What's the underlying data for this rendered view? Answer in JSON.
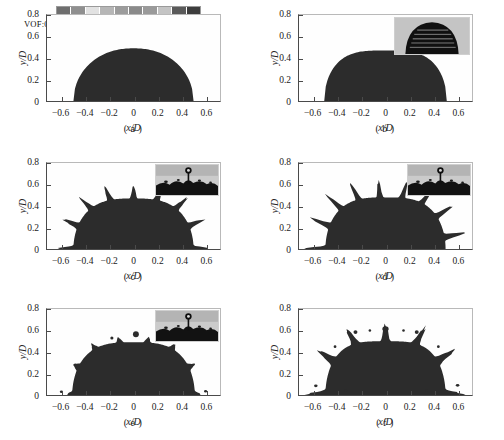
{
  "figure": {
    "type": "multi-panel-contour",
    "panel_count": 6,
    "colors": {
      "liquid": "#2c2c2c",
      "liquid_edge": "#3a3a3a",
      "background": "#fefefe",
      "axis": "#4a4a4a",
      "inset_bg": "#c9c9c9",
      "inset_dark": "#141414"
    }
  },
  "axes": {
    "xlabel": "x/D",
    "ylabel": "y/D",
    "xticks": [
      "-0.6",
      "-0.4",
      "-0.2",
      "0",
      "0.2",
      "0.4",
      "0.6"
    ],
    "xtick_values": [
      -0.6,
      -0.4,
      -0.2,
      0,
      0.2,
      0.4,
      0.6
    ],
    "yticks": [
      "0",
      "0.2",
      "0.4",
      "0.6",
      "0.8"
    ],
    "ytick_values": [
      0,
      0.2,
      0.4,
      0.6,
      0.8
    ],
    "xlim": [
      -0.72,
      0.72
    ],
    "ylim": [
      0,
      0.8
    ]
  },
  "colorbar": {
    "title": "VOF:",
    "labels": [
      "0.1",
      "0.2",
      "0.3",
      "0.4",
      "0.5",
      "0.6",
      "0.7",
      "0.8",
      "0.9"
    ],
    "values": [
      0.1,
      0.2,
      0.3,
      0.4,
      0.5,
      0.6,
      0.7,
      0.8,
      0.9
    ],
    "swatches": [
      "#6e6e6e",
      "#8f8f8f",
      "#e2e2e2",
      "#b6b6b6",
      "#9c9c9c",
      "#8a8a8a",
      "#9a9a9a",
      "#c4c4c4",
      "#5a5a5a",
      "#3d3d3d"
    ]
  },
  "ghost_ticks": [
    "0.8",
    "0.6",
    "0.4"
  ],
  "panels": [
    {
      "id": "a",
      "caption": "( a )",
      "has_colorbar": true,
      "has_inset": false,
      "description": "spherical-cap droplet at initial spreading",
      "spread_half_width": 0.5,
      "crown_height": 0.49,
      "finger_count": 0
    },
    {
      "id": "b",
      "caption": "( b )",
      "has_colorbar": false,
      "has_inset": true,
      "inset_type": "dome-streaks",
      "description": "flattened lamella, smooth rim",
      "spread_half_width": 0.51,
      "crown_height": 0.47,
      "finger_count": 0
    },
    {
      "id": "c",
      "caption": "( c )",
      "has_colorbar": false,
      "has_inset": true,
      "inset_type": "crown-splash",
      "description": "rim destabilised into radial fingers",
      "spread_half_width": 0.63,
      "crown_height": 0.54,
      "finger_count": 16
    },
    {
      "id": "d",
      "caption": "( d )",
      "has_colorbar": false,
      "has_inset": true,
      "inset_type": "crown-with-satellite",
      "description": "elongated fingers, crown fully formed",
      "spread_half_width": 0.64,
      "crown_height": 0.56,
      "finger_count": 17
    },
    {
      "id": "e",
      "caption": "( e )",
      "has_colorbar": false,
      "has_inset": true,
      "inset_type": "crown-with-satellite",
      "description": "receding lamella with small satellite droplets",
      "spread_half_width": 0.58,
      "crown_height": 0.56,
      "finger_count": 8
    },
    {
      "id": "f",
      "caption": "( f )",
      "has_colorbar": false,
      "has_inset": false,
      "description": "thick fingers with detached secondary droplets",
      "spread_half_width": 0.66,
      "crown_height": 0.62,
      "finger_count": 11
    }
  ]
}
